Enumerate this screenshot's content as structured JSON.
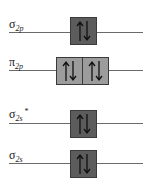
{
  "diagram": {
    "colors": {
      "filled_sigma": "#5c5c5c",
      "filled_pi": "#9c9c9c",
      "line": "#6a6a6a"
    },
    "levels": [
      {
        "symbol": "σ",
        "subscript": "2p",
        "superscript": "",
        "orbitals": 1,
        "electrons": "↑↓",
        "shade": "dark"
      },
      {
        "symbol": "π",
        "subscript": "2p",
        "superscript": "",
        "orbitals": 2,
        "electrons": "↑↓ ↑↓",
        "shade": "light"
      },
      {
        "symbol": "σ",
        "subscript": "2s",
        "superscript": "*",
        "orbitals": 1,
        "electrons": "↑↓",
        "shade": "dark"
      },
      {
        "symbol": "σ",
        "subscript": "2s",
        "superscript": "",
        "orbitals": 1,
        "electrons": "↑↓",
        "shade": "dark"
      }
    ]
  }
}
